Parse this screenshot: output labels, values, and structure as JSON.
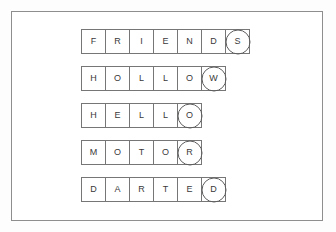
{
  "worksheet": {
    "background_color": "#ffffff",
    "frame_color": "#8e8e8e",
    "cell_border_color": "#767676",
    "circle_color": "#5d5d5d",
    "letter_color": "#3a3a3a",
    "rows": [
      {
        "word": "FRIENDS",
        "letters": [
          "F",
          "R",
          "I",
          "E",
          "N",
          "D",
          "S"
        ],
        "circled_index": 6,
        "circled_letter": "S"
      },
      {
        "word": "HOLLOW",
        "letters": [
          "H",
          "O",
          "L",
          "L",
          "O",
          "W"
        ],
        "circled_index": 5,
        "circled_letter": "W"
      },
      {
        "word": "HELLO",
        "letters": [
          "H",
          "E",
          "L",
          "L",
          "O"
        ],
        "circled_index": 4,
        "circled_letter": "O"
      },
      {
        "word": "MOTOR",
        "letters": [
          "M",
          "O",
          "T",
          "O",
          "R"
        ],
        "circled_index": 4,
        "circled_letter": "R"
      },
      {
        "word": "DARTED",
        "letters": [
          "D",
          "A",
          "R",
          "T",
          "E",
          "D"
        ],
        "circled_index": 5,
        "circled_letter": "D"
      }
    ]
  }
}
